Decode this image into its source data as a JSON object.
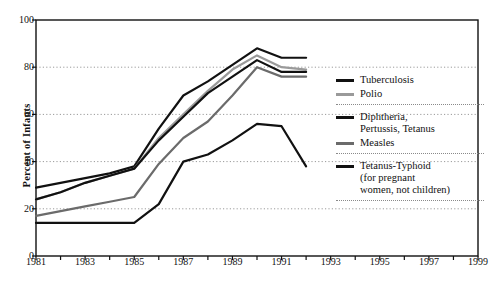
{
  "chart_data": {
    "type": "line",
    "title": "",
    "xlabel": "",
    "ylabel": "Percent of Infants",
    "xlim": [
      1981,
      1999
    ],
    "ylim": [
      0,
      100
    ],
    "grid": "horizontal-dotted",
    "legend_position": "right",
    "x_ticks": [
      1981,
      1982,
      1983,
      1984,
      1985,
      1986,
      1987,
      1988,
      1989,
      1990,
      1991,
      1992,
      1993,
      1994,
      1995,
      1996,
      1997,
      1998,
      1999
    ],
    "x_tick_labels": [
      "1981",
      "",
      "1983",
      "",
      "1985",
      "",
      "1987",
      "",
      "1989",
      "",
      "1991",
      "",
      "1993",
      "",
      "1995",
      "",
      "1997",
      "",
      "1999"
    ],
    "y_ticks": [
      0,
      20,
      40,
      60,
      80,
      100
    ],
    "y_tick_labels": [
      "0",
      "20",
      "40",
      "60",
      "80",
      "100"
    ],
    "x": [
      1981,
      1982,
      1983,
      1984,
      1985,
      1986,
      1987,
      1988,
      1989,
      1990,
      1991,
      1992
    ],
    "series": [
      {
        "name": "Tuberculosis",
        "color": "#111111",
        "width": 2.2,
        "values": [
          29,
          31,
          33,
          35,
          38,
          54,
          68,
          74,
          81,
          88,
          84,
          84
        ]
      },
      {
        "name": "Polio",
        "color": "#9a9a9a",
        "width": 2.2,
        "values": [
          24,
          27,
          31,
          34,
          37,
          50,
          60,
          70,
          79,
          85,
          80,
          79
        ]
      },
      {
        "name": "Diphtheria, Pertussis, Tetanus",
        "color": "#111111",
        "width": 2.2,
        "values": [
          24,
          27,
          31,
          34,
          37,
          49,
          59,
          69,
          76,
          83,
          78,
          78
        ]
      },
      {
        "name": "Measles",
        "color": "#6b6b6b",
        "width": 2.2,
        "values": [
          17,
          19,
          21,
          23,
          25,
          39,
          50,
          57,
          68,
          80,
          76,
          76
        ]
      },
      {
        "name": "Tetanus-Typhoid (for pregnant women, not children)",
        "color": "#111111",
        "width": 2.2,
        "values": [
          14,
          14,
          14,
          14,
          14,
          22,
          40,
          43,
          49,
          56,
          55,
          38
        ]
      }
    ]
  },
  "axes": {
    "y_title": "Percent of Infants"
  },
  "legend": {
    "groups": [
      {
        "entries": [
          {
            "label": "Tuberculosis",
            "color": "#111111",
            "swatch_height": 3
          },
          {
            "label": "Polio",
            "color": "#9a9a9a",
            "swatch_height": 3
          }
        ]
      },
      {
        "entries": [
          {
            "label": "Diphtheria,\nPertussis, Tetanus",
            "color": "#111111",
            "swatch_height": 3
          },
          {
            "label": "Measles",
            "color": "#6b6b6b",
            "swatch_height": 3
          }
        ]
      },
      {
        "entries": [
          {
            "label": "Tetanus-Typhoid\n(for pregnant\nwomen, not children)",
            "color": "#111111",
            "swatch_height": 3
          }
        ]
      }
    ]
  },
  "colors": {
    "axis": "#111111",
    "gridline": "#9a9a9a",
    "background": "#ffffff"
  }
}
